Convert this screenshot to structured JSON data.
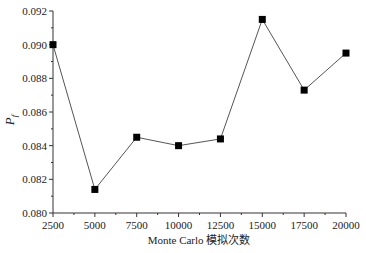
{
  "chart_data": {
    "type": "line",
    "title": "",
    "xlabel": "Monte Carlo 模拟次数",
    "ylabel": "P_f",
    "ylabel_main": "P",
    "ylabel_sub": "f",
    "x": [
      2500,
      5000,
      7500,
      10000,
      12500,
      15000,
      17500,
      20000
    ],
    "series": [
      {
        "name": "P_f",
        "values": [
          0.09,
          0.0814,
          0.0845,
          0.084,
          0.0844,
          0.0915,
          0.0873,
          0.0895
        ],
        "marker": "square",
        "color": "#000000",
        "line_color": "#555555"
      }
    ],
    "xlim": [
      2500,
      20000
    ],
    "ylim": [
      0.08,
      0.092
    ],
    "xticks": [
      "2500",
      "5000",
      "7500",
      "10000",
      "12500",
      "15000",
      "17500",
      "20000"
    ],
    "yticks": [
      "0.080",
      "0.082",
      "0.084",
      "0.086",
      "0.088",
      "0.090",
      "0.092"
    ],
    "grid": false,
    "legend": "none"
  }
}
